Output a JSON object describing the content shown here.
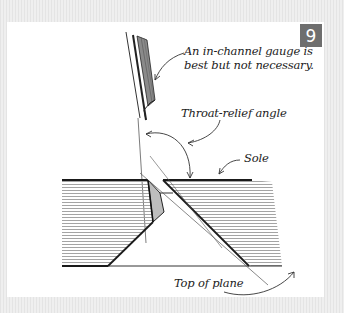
{
  "figure": {
    "number": "9",
    "badge_color": "#6e6e6e",
    "labels": {
      "gauge_line1": "An in-channel gauge is",
      "gauge_line2": "best but not necessary.",
      "throat_relief": "Throat-relief angle",
      "sole": "Sole",
      "top_of_plane": "Top of plane"
    }
  }
}
